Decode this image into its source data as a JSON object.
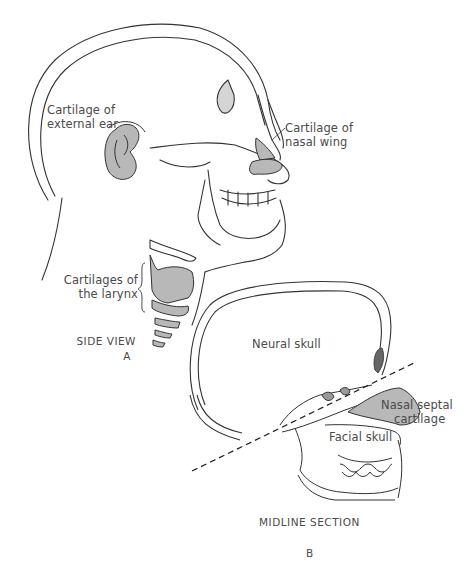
{
  "figure": {
    "panel_a": {
      "caption": "SIDE VIEW",
      "letter": "A",
      "labels": {
        "ear": [
          "Cartilage of",
          "external ear"
        ],
        "nose": [
          "Cartilage of",
          "nasal wing"
        ],
        "larynx": [
          "Cartilages of",
          "the larynx"
        ]
      }
    },
    "panel_b": {
      "caption": "MIDLINE SECTION",
      "letter": "B",
      "labels": {
        "neural": "Neural skull",
        "septal": [
          "Nasal septal",
          "cartilage"
        ],
        "facial": "Facial skull"
      }
    },
    "colors": {
      "cartilage_fill": "#b8b8b8",
      "line": "#333333",
      "text": "#4a4a4a"
    }
  }
}
